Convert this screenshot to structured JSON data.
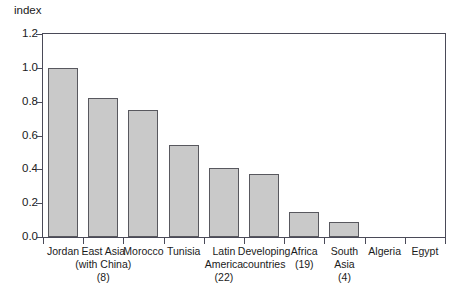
{
  "chart_data": {
    "type": "bar",
    "title": "",
    "subtitle": "",
    "xlabel": "",
    "ylabel": "index",
    "ylim": [
      0.0,
      1.2
    ],
    "ytick_labels": [
      "1.2",
      "1.0",
      "0.8",
      "0.6",
      "0.4",
      "0.2",
      "0.0"
    ],
    "ytick_values": [
      1.2,
      1.0,
      0.8,
      0.6,
      0.4,
      0.2,
      0.0
    ],
    "grid": false,
    "legend": null,
    "categories": [
      "Jordan",
      "East Asia (with China) (8)",
      "Morocco",
      "Tunisia",
      "Latin America (22)",
      "Developing countries",
      "Africa (19)",
      "South Asia (4)",
      "Algeria",
      "Egypt"
    ],
    "values": [
      1.0,
      0.82,
      0.75,
      0.545,
      0.41,
      0.375,
      0.145,
      0.09,
      0.0,
      0.0
    ],
    "bar_color": "#c9c9c9",
    "bar_edge_color": "#58585e",
    "axis_color": "#4a4a58"
  },
  "axis": {
    "y_unit_label": "index"
  },
  "x_categories": [
    {
      "line1": "Jordan",
      "line2": "",
      "line3": ""
    },
    {
      "line1": "East Asia",
      "line2": "(with China)",
      "line3": "(8)"
    },
    {
      "line1": "Morocco",
      "line2": "",
      "line3": ""
    },
    {
      "line1": "Tunisia",
      "line2": "",
      "line3": ""
    },
    {
      "line1": "Latin",
      "line2": "America",
      "line3": "(22)"
    },
    {
      "line1": "Developing",
      "line2": "countries",
      "line3": ""
    },
    {
      "line1": "Africa",
      "line2": "(19)",
      "line3": ""
    },
    {
      "line1": "South",
      "line2": "Asia",
      "line3": "(4)"
    },
    {
      "line1": "Algeria",
      "line2": "",
      "line3": ""
    },
    {
      "line1": "Egypt",
      "line2": "",
      "line3": ""
    }
  ]
}
